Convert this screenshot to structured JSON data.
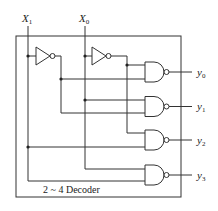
{
  "diagram": {
    "title": "2 ~ 4 Decoder",
    "inputs": [
      {
        "name": "X",
        "sub": "1"
      },
      {
        "name": "X",
        "sub": "0"
      }
    ],
    "outputs": [
      {
        "name": "y",
        "sub": "0"
      },
      {
        "name": "y",
        "sub": "1"
      },
      {
        "name": "y",
        "sub": "2"
      },
      {
        "name": "y",
        "sub": "3"
      }
    ],
    "gates": {
      "inverters": [
        "NOT X1",
        "NOT X0"
      ],
      "nand": [
        {
          "output": "y0",
          "inputs": [
            "X0'",
            "X1'"
          ]
        },
        {
          "output": "y1",
          "inputs": [
            "X0",
            "X1'"
          ]
        },
        {
          "output": "y2",
          "inputs": [
            "X0'",
            "X1"
          ]
        },
        {
          "output": "y3",
          "inputs": [
            "X0",
            "X1"
          ]
        }
      ]
    },
    "colors": {
      "line": "#333333",
      "background": "#ffffff"
    }
  }
}
